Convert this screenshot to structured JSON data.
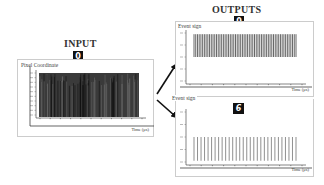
{
  "input": {
    "title": "INPUT",
    "digit": "0",
    "panel_label": "Pixel Coordinate",
    "x_axis_label": "Time (μs)"
  },
  "outputs": {
    "title": "OUTPUTS",
    "panels": [
      {
        "label": "Event sign",
        "digit": "0",
        "x_axis_label": "Time (μs)"
      },
      {
        "label": "Event sign",
        "digit": "6",
        "x_axis_label": "Time (μs)"
      }
    ]
  },
  "chart_data": [
    {
      "type": "bar",
      "title": "Pixel Coordinate",
      "xlabel": "Time (μs)",
      "ylabel": "Pixel Coordinate",
      "description": "Dense spike raster of input pixel events filling most of the y-range",
      "x_ticks": 11,
      "y_ticks": 10,
      "spike_count": 90,
      "fill_fraction": 0.92,
      "grid": false
    },
    {
      "type": "bar",
      "title": "Event sign (digit 0)",
      "xlabel": "Time (μs)",
      "ylabel": "Event sign",
      "y_tick_labels": [
        "1",
        "0.5",
        "0",
        "-0.5",
        "-1"
      ],
      "description": "Dense positive event spikes from 0 to 1",
      "x_ticks": 11,
      "spike_count": 60,
      "spike_from": 0,
      "spike_to": 1,
      "grid": false
    },
    {
      "type": "bar",
      "title": "Event sign (digit 6)",
      "xlabel": "Time (μs)",
      "ylabel": "Event sign",
      "y_tick_labels": [
        "1",
        "0.5",
        "0",
        "-0.5",
        "-1"
      ],
      "description": "Sparse negative event spikes from 0 to -1",
      "x_ticks": 11,
      "spike_count": 30,
      "spike_from": 0,
      "spike_to": -1,
      "grid": false
    }
  ]
}
